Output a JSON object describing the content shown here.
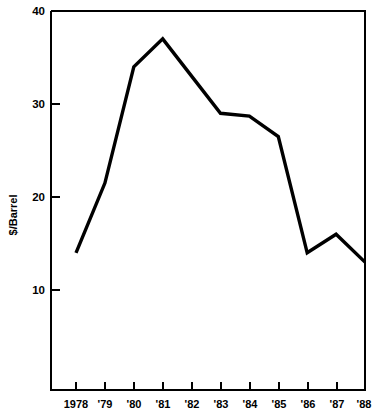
{
  "chart_data": {
    "type": "line",
    "title": "",
    "subtitle": "",
    "xlabel": "",
    "ylabel": "$/Barrel",
    "categories": [
      "1978",
      "'79",
      "'80",
      "'81",
      "'82",
      "'83",
      "'84",
      "'85",
      "'86",
      "'87",
      "'88"
    ],
    "x_values": [
      1978,
      1979,
      1980,
      1981,
      1982,
      1983,
      1984,
      1985,
      1986,
      1987,
      1988
    ],
    "values": [
      14.0,
      21.5,
      34.0,
      37.0,
      33.0,
      29.0,
      28.7,
      26.5,
      14.0,
      16.0,
      13.0
    ],
    "series": [
      {
        "name": "$/Barrel",
        "values": [
          14.0,
          21.5,
          34.0,
          37.0,
          33.0,
          29.0,
          28.7,
          26.5,
          14.0,
          16.0,
          13.0
        ],
        "color": "#000000"
      }
    ],
    "ylim": [
      0,
      40
    ],
    "yticks": [
      10,
      20,
      30,
      40
    ],
    "ytick_labels": [
      "10",
      "20",
      "30",
      "40"
    ],
    "xlim": [
      1978,
      1988
    ],
    "grid": false,
    "legend": false,
    "legend_position": "none"
  },
  "yaxis": {
    "label": "$/Barrel",
    "ticks": [
      {
        "label": "40",
        "value": 40
      },
      {
        "label": "30",
        "value": 30
      },
      {
        "label": "20",
        "value": 20
      },
      {
        "label": "10",
        "value": 10
      }
    ]
  },
  "xaxis": {
    "label": "",
    "ticks": [
      {
        "label": "1978",
        "value": 1978
      },
      {
        "label": "'79",
        "value": 1979
      },
      {
        "label": "'80",
        "value": 1980
      },
      {
        "label": "'81",
        "value": 1981
      },
      {
        "label": "'82",
        "value": 1982
      },
      {
        "label": "'83",
        "value": 1983
      },
      {
        "label": "'84",
        "value": 1984
      },
      {
        "label": "'85",
        "value": 1985
      },
      {
        "label": "'86",
        "value": 1986
      },
      {
        "label": "'87",
        "value": 1987
      },
      {
        "label": "'88",
        "value": 1988
      }
    ]
  },
  "colors": {
    "line": "#000000",
    "axis": "#000000",
    "background": "#ffffff",
    "text": "#000000"
  }
}
